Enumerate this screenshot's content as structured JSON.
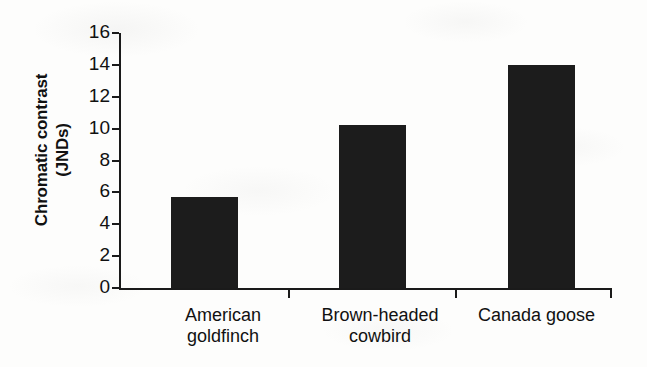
{
  "chart_data": {
    "type": "bar",
    "title": "",
    "xlabel": "",
    "ylabel": "Chromatic contrast (JNDs)",
    "ylabel_line1": "Chromatic contrast",
    "ylabel_line2": "(JNDs)",
    "categories": [
      "American goldfinch",
      "Brown-headed cowbird",
      "Canada goose"
    ],
    "category_lines": [
      [
        "American",
        "goldfinch"
      ],
      [
        "Brown-headed",
        "cowbird"
      ],
      [
        "Canada goose",
        ""
      ]
    ],
    "values": [
      5.7,
      10.2,
      14.0
    ],
    "ylim": [
      0,
      16
    ],
    "yticks": [
      0,
      2,
      4,
      6,
      8,
      10,
      12,
      14,
      16
    ],
    "ytick_labels": [
      "0",
      "2",
      "4",
      "6",
      "8",
      "10",
      "12",
      "14",
      "16"
    ],
    "grid": false,
    "legend": false,
    "bar_color": "#1c1c1c",
    "axis_color": "#1a1a1a",
    "background_color": "#fdfdfc"
  }
}
